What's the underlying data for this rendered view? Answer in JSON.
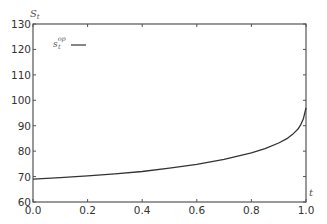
{
  "chart_data": {
    "type": "line",
    "title": "",
    "xlabel": "t",
    "ylabel": "S_t",
    "xlim": [
      0.0,
      1.0
    ],
    "ylim": [
      60,
      130
    ],
    "grid": false,
    "legend_position": "upper left",
    "x_ticks": [
      "0.0",
      "0.2",
      "0.4",
      "0.6",
      "0.8",
      "1.0"
    ],
    "y_ticks": [
      "60",
      "70",
      "80",
      "90",
      "100",
      "110",
      "120",
      "130"
    ],
    "series": [
      {
        "name": "s_t^op",
        "color": "#333333",
        "x": [
          0.0,
          0.1,
          0.2,
          0.3,
          0.4,
          0.5,
          0.6,
          0.7,
          0.8,
          0.85,
          0.9,
          0.93,
          0.95,
          0.97,
          0.98,
          0.99,
          1.0
        ],
        "values": [
          69.0,
          69.6,
          70.3,
          71.1,
          72.0,
          73.3,
          74.8,
          76.8,
          79.3,
          81.0,
          83.2,
          84.9,
          86.5,
          88.6,
          90.2,
          92.6,
          97.0
        ]
      }
    ]
  },
  "labels": {
    "y_axis_var": "S",
    "y_axis_sub": "t",
    "x_axis_var": "t",
    "legend_main": "s",
    "legend_sub": "t",
    "legend_sup": "op"
  },
  "colors": {
    "axis": "#555555",
    "line": "#333333",
    "text": "#333333"
  }
}
